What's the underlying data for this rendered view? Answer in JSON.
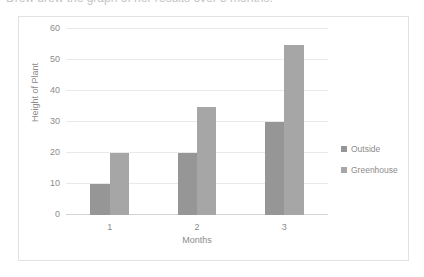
{
  "caption": {
    "text": "Drew drew the graph of her results over 3 months."
  },
  "legend": {
    "position": "right",
    "items": [
      {
        "label": "Outside",
        "color": "#969696"
      },
      {
        "label": "Greenhouse",
        "color": "#a6a6a6"
      }
    ]
  },
  "chart_data": {
    "type": "bar",
    "title": "",
    "categories": [
      "1",
      "2",
      "3"
    ],
    "series": [
      {
        "name": "Outside",
        "values": [
          10,
          20,
          30
        ],
        "color": "#969696"
      },
      {
        "name": "Greenhouse",
        "values": [
          20,
          35,
          55
        ],
        "color": "#a6a6a6"
      }
    ],
    "xlabel": "Months",
    "ylabel": "Height of Plant",
    "ylim": [
      0,
      60
    ],
    "yticks": [
      0,
      10,
      20,
      30,
      40,
      50,
      60
    ],
    "ytick_labels": [
      "0",
      "10",
      "20",
      "30",
      "40",
      "50",
      "60"
    ],
    "grid": true,
    "grid_axis": "y",
    "legend_position": "right",
    "background": "#ffffff",
    "border_color": "#e2e2e2"
  }
}
